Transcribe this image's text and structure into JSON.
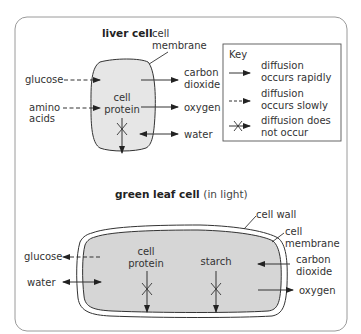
{
  "liver": {
    "title": "liver cell",
    "membrane_l1": "cell",
    "membrane_l2": "membrane",
    "inside_l1": "cell",
    "inside_l2": "protein",
    "glucose": "glucose",
    "amino_l1": "amino",
    "amino_l2": "acids",
    "co2_l1": "carbon",
    "co2_l2": "dioxide",
    "oxygen": "oxygen",
    "water": "water"
  },
  "key": {
    "title": "Key",
    "rapid_l1": "diffusion",
    "rapid_l2": "occurs rapidly",
    "slow_l1": "diffusion",
    "slow_l2": "occurs slowly",
    "none_l1": "diffusion does",
    "none_l2": "not occur"
  },
  "leaf": {
    "title": "green leaf cell",
    "title_sub": "(in light)",
    "wall": "cell wall",
    "membrane_l1": "cell",
    "membrane_l2": "membrane",
    "protein_l1": "cell",
    "protein_l2": "protein",
    "starch": "starch",
    "glucose": "glucose",
    "water": "water",
    "co2_l1": "carbon",
    "co2_l2": "dioxide",
    "oxygen": "oxygen"
  },
  "colors": {
    "cell_fill": "#e6e6e6",
    "leaf_fill": "#d6d6d6",
    "line": "#333333",
    "frame": "#999999"
  }
}
